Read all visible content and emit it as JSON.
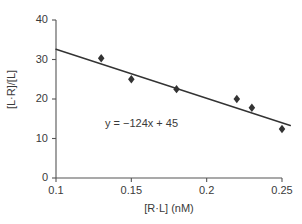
{
  "chart_data": {
    "type": "scatter",
    "title": "",
    "xlabel": "[R·L] (nM)",
    "ylabel": "[L·R]/[L]",
    "xlim": [
      0.1,
      0.25
    ],
    "ylim": [
      0,
      40
    ],
    "grid": false,
    "legend": "none",
    "marker": "diamond",
    "marker_color": "#333333",
    "line_color": "#333333",
    "axis_color": "#555555",
    "background": "#ffffff",
    "xticks": [
      "0.1",
      "0.15",
      "0.2",
      "0.25"
    ],
    "xtick_values": [
      0.1,
      0.15,
      0.2,
      0.25
    ],
    "yticks": [
      "0",
      "10",
      "20",
      "30",
      "40"
    ],
    "ytick_values": [
      0,
      10,
      20,
      30,
      40
    ],
    "points": [
      {
        "x": 0.13,
        "y": 30.3
      },
      {
        "x": 0.15,
        "y": 25.0
      },
      {
        "x": 0.18,
        "y": 22.5
      },
      {
        "x": 0.22,
        "y": 20.0
      },
      {
        "x": 0.23,
        "y": 17.8
      },
      {
        "x": 0.25,
        "y": 12.4
      }
    ],
    "fit_line": {
      "slope": -124,
      "intercept": 45,
      "x_start": 0.1,
      "x_end": 0.2555,
      "y_start": 32.6,
      "y_end": 13.3
    },
    "annotations": [
      {
        "name": "regression-equation",
        "text": "y = −124x + 45",
        "x": 0.162,
        "y": 15.5
      }
    ]
  }
}
